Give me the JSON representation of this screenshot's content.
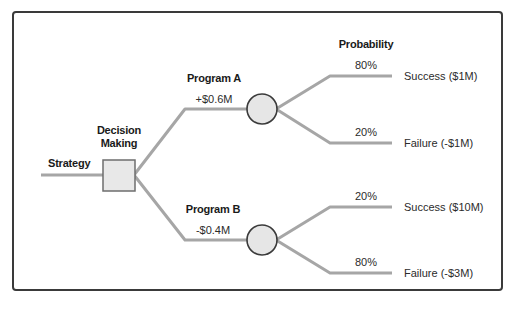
{
  "diagram": {
    "type": "decision-tree",
    "colors": {
      "frame": "#3a3a3a",
      "line": "#a6a6a6",
      "node_fill": "#e6e6e6",
      "node_stroke": "#3a3a3a",
      "text": "#2b2b2b"
    },
    "root": {
      "label": "Strategy"
    },
    "decision_node": {
      "label_line1": "Decision",
      "label_line2": "Making"
    },
    "probability_header": "Probability",
    "options": [
      {
        "name": "Program A",
        "value": "+$0.6M",
        "outcomes": [
          {
            "probability": "80%",
            "label": "Success ($1M)"
          },
          {
            "probability": "20%",
            "label": "Failure (-$1M)"
          }
        ]
      },
      {
        "name": "Program B",
        "value": "-$0.4M",
        "outcomes": [
          {
            "probability": "20%",
            "label": "Success ($10M)"
          },
          {
            "probability": "80%",
            "label": "Failure (-$3M)"
          }
        ]
      }
    ]
  }
}
